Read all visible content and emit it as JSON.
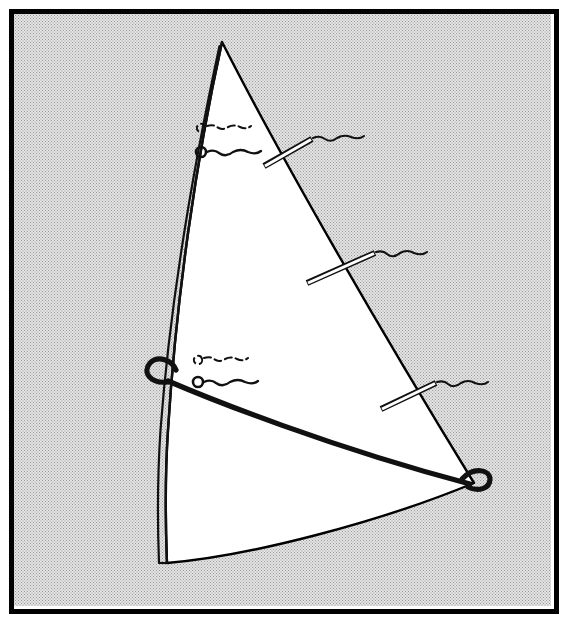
{
  "figure": {
    "kind": "technical-line-drawing",
    "caption": "",
    "canvas": {
      "width": 571,
      "height": 626
    },
    "colors": {
      "ink": "#000000",
      "sail_fill": "#ffffff",
      "background_tone": "#d9d9d9",
      "background_tone_dot": "#8c8c8c",
      "page": "#ffffff"
    },
    "frame": {
      "name": "figure-border",
      "x": 9,
      "y": 9,
      "width": 545,
      "height": 600,
      "stroke_width": 5
    },
    "background": {
      "name": "halftone-screen-tone",
      "pattern": "dotted-halftone",
      "cell_size": 3
    },
    "sail": {
      "name": "sail-body",
      "head_point": "222,42",
      "tack_point": "167,563",
      "clew_point": "474,483",
      "luff_outline": "M222,42 C196,160 176,300 168,430 C164,490 166,535 167,563",
      "leech_outline": "M222,42 C282,160 380,330 474,483",
      "foot_outline": "M167,563 C250,556 380,522 474,483",
      "fill": "#ffffff",
      "stroke_width": 2.4
    },
    "mast_sleeve": {
      "name": "mast-sleeve-luff-pocket",
      "path": "M219,45 C193,163 169,302 160,430 C156,490 158,536 159,563",
      "stroke_width": 2.0,
      "description": "double-line luff sleeve running from head to tack"
    },
    "boom": {
      "name": "boom-outhaul-line",
      "path": "M162,377 C200,396 330,445 468,482",
      "stroke_width": 5.2,
      "luff_loop": {
        "name": "boom-luff-loop",
        "cx": 163,
        "cy": 372,
        "rx": 13,
        "ry": 11,
        "rotation": -28
      },
      "clew_loop": {
        "name": "boom-clew-loop",
        "cx": 474,
        "cy": 478,
        "rx": 12,
        "ry": 9,
        "rotation": 16
      }
    },
    "battens": [
      {
        "name": "batten-top",
        "label": "",
        "inner_x": 264,
        "inner_y": 166,
        "outer_x": 312,
        "outer_y": 139,
        "thickness": 5.5,
        "telltale": {
          "name": "batten-telltale-top",
          "path": "M313,138 q7,-3 12,1 q6,4 12,-1 q7,-4 14,-1 q8,3 13,-1",
          "style": "wavy-solid"
        }
      },
      {
        "name": "batten-middle",
        "label": "",
        "inner_x": 307,
        "inner_y": 283,
        "outer_x": 375,
        "outer_y": 253,
        "thickness": 5.5,
        "telltale": {
          "name": "batten-telltale-middle",
          "path": "M376,252 q7,-2 11,2 q6,5 13,-1 q7,-4 14,0 q8,3 13,-1",
          "style": "wavy-solid"
        }
      },
      {
        "name": "batten-bottom",
        "label": "",
        "inner_x": 381,
        "inner_y": 409,
        "outer_x": 436,
        "outer_y": 383,
        "thickness": 5.5,
        "telltale": {
          "name": "batten-telltale-bottom",
          "path": "M437,382 q7,-2 11,2 q6,5 13,-1 q7,-4 14,0 q8,3 13,-1",
          "style": "wavy-solid"
        }
      }
    ],
    "telltale_pairs": [
      {
        "name": "telltale-pair-upper",
        "position": "upper-luff-area",
        "far_side": {
          "name": "telltale-far-side-upper",
          "style": "dashed",
          "grommet": {
            "cx": 201,
            "cy": 128,
            "r": 4.2,
            "open": true
          },
          "tail_path": "M206,127 q6,-2 10,1 q5,4 11,0 q6,-3 12,0 q6,3 11,-1"
        },
        "near_side": {
          "name": "telltale-near-side-upper",
          "style": "solid",
          "grommet": {
            "cx": 201,
            "cy": 152,
            "r": 5.0,
            "open": true
          },
          "tail_path": "M207,152 q7,-3 12,1 q7,5 14,-1 q8,-4 15,0 q8,3 13,-1"
        }
      },
      {
        "name": "telltale-pair-lower",
        "position": "lower-luff-area",
        "far_side": {
          "name": "telltale-far-side-lower",
          "style": "dashed",
          "grommet": {
            "cx": 198,
            "cy": 360,
            "r": 4.2,
            "open": true
          },
          "tail_path": "M203,359 q6,-2 10,1 q5,4 11,0 q6,-3 12,0 q6,3 11,-1"
        },
        "near_side": {
          "name": "telltale-near-side-lower",
          "style": "solid",
          "grommet": {
            "cx": 198,
            "cy": 382,
            "r": 5.0,
            "open": true
          },
          "tail_path": "M204,382 q7,-3 12,1 q7,5 14,-1 q8,-4 15,0 q8,3 13,-1"
        }
      }
    ],
    "annotations": {
      "reference_numerals": [],
      "text_labels": []
    }
  }
}
